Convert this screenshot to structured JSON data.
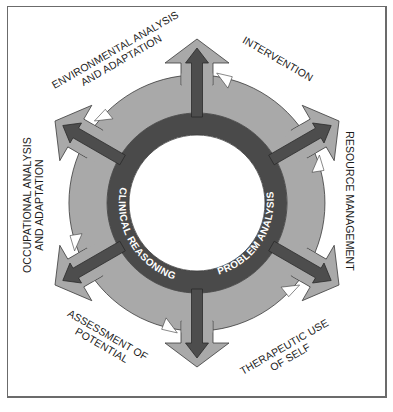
{
  "diagram": {
    "type": "cyclic-ring",
    "center_label": "",
    "inner_ring": {
      "labels": [
        {
          "id": "case-management",
          "text": "CASE MANAGEMENT"
        },
        {
          "id": "problem-analysis",
          "text": "PROBLEM ANALYSIS"
        },
        {
          "id": "clinical-reasoning",
          "text": "CLINICAL REASONING"
        }
      ]
    },
    "outer_labels": [
      {
        "id": "environmental",
        "lines": [
          "ENVIRONMENTAL ANALYSIS",
          "AND ADAPTATION"
        ]
      },
      {
        "id": "intervention",
        "lines": [
          "INTERVENTION"
        ]
      },
      {
        "id": "resource",
        "lines": [
          "RESOURCE MANAGEMENT"
        ]
      },
      {
        "id": "therapeutic",
        "lines": [
          "THERAPEUTIC USE",
          "OF SELF"
        ]
      },
      {
        "id": "assessment",
        "lines": [
          "ASSESSMENT OF",
          "POTENTIAL"
        ]
      },
      {
        "id": "occupational",
        "lines": [
          "OCCUPATIONAL ANALYSIS",
          "AND ADAPTATION"
        ]
      }
    ],
    "spokes": [
      "up",
      "upper-right",
      "lower-right",
      "down",
      "lower-left",
      "upper-left"
    ],
    "colors": {
      "inner_ring": "#4a4a4a",
      "outer_band": "#a9a9a9",
      "spoke_arrow": "#4d4d4d",
      "outline": "#3a3a3a",
      "center": "#ffffff",
      "frame": "#6b6b6b"
    }
  }
}
